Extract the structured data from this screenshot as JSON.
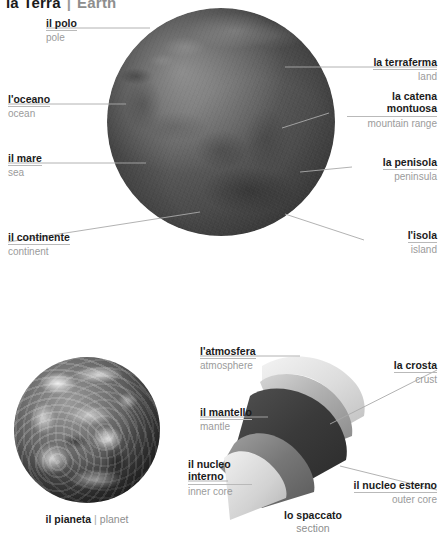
{
  "title": {
    "it": "la Terra",
    "separator": "|",
    "en": "Earth"
  },
  "top_figure": {
    "name": "relief-globe",
    "labels": [
      {
        "id": "pole",
        "it": "il polo",
        "en": "pole",
        "side": "left"
      },
      {
        "id": "ocean",
        "it": "l'oceano",
        "en": "ocean",
        "side": "left"
      },
      {
        "id": "sea",
        "it": "il mare",
        "en": "sea",
        "side": "left"
      },
      {
        "id": "continent",
        "it": "il continente",
        "en": "continent",
        "side": "left"
      },
      {
        "id": "land",
        "it": "la terraferma",
        "en": "land",
        "side": "right"
      },
      {
        "id": "mountain-range",
        "it": "la catena montuosa",
        "en": "mountain range",
        "side": "right"
      },
      {
        "id": "peninsula",
        "it": "la penisola",
        "en": "peninsula",
        "side": "right"
      },
      {
        "id": "island",
        "it": "l'isola",
        "en": "island",
        "side": "right"
      }
    ]
  },
  "bottom_left_figure": {
    "name": "planet-globe",
    "caption": {
      "it": "il pianeta",
      "separator": "|",
      "en": "planet"
    }
  },
  "bottom_right_figure": {
    "name": "section-cutaway",
    "caption": {
      "it": "lo spaccato",
      "en": "section"
    },
    "labels": [
      {
        "id": "atmosphere",
        "it": "l'atmosfera",
        "en": "atmosphere",
        "side": "left"
      },
      {
        "id": "mantle",
        "it": "il mantello",
        "en": "mantle",
        "side": "left"
      },
      {
        "id": "inner-core",
        "it": "il nucleo interno",
        "en": "inner core",
        "side": "left"
      },
      {
        "id": "crust",
        "it": "la crosta",
        "en": "crust",
        "side": "right"
      },
      {
        "id": "outer-core",
        "it": "il nucleo esterno",
        "en": "outer core",
        "side": "right"
      }
    ]
  },
  "colors": {
    "italian_text": "#1b1b1b",
    "english_text": "#9b9b9b",
    "rule_line": "#b9b9b9",
    "leader_line": "#a9a9a9",
    "background": "#ffffff"
  }
}
